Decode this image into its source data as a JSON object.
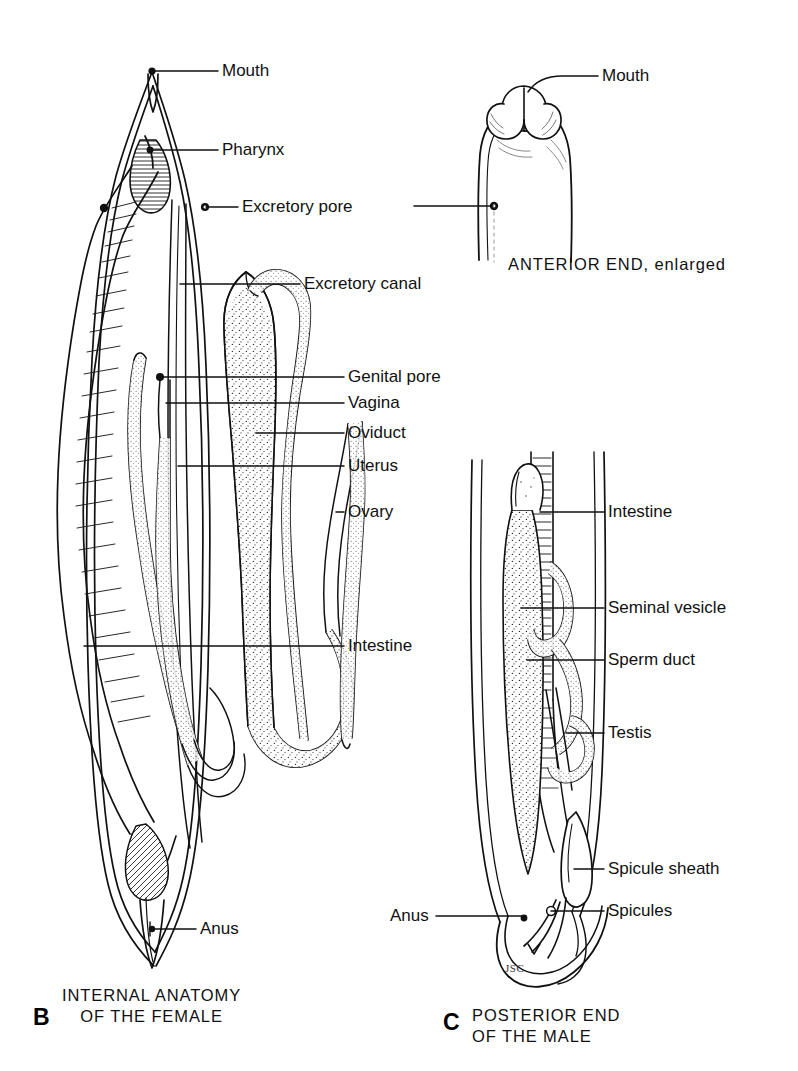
{
  "figure": {
    "ink_color": "#111111",
    "background_color": "#ffffff"
  },
  "panels": [
    {
      "id": "B",
      "letter": "B",
      "caption_line1": "INTERNAL ANATOMY",
      "caption_line2": "OF THE FEMALE",
      "labels": [
        {
          "name": "mouth",
          "text": "Mouth"
        },
        {
          "name": "pharynx",
          "text": "Pharynx"
        },
        {
          "name": "excretory-pore",
          "text": "Excretory pore"
        },
        {
          "name": "excretory-canal",
          "text": "Excretory canal"
        },
        {
          "name": "genital-pore",
          "text": "Genital pore"
        },
        {
          "name": "vagina",
          "text": "Vagina"
        },
        {
          "name": "oviduct",
          "text": "Oviduct"
        },
        {
          "name": "uterus",
          "text": "Uterus"
        },
        {
          "name": "ovary",
          "text": "Ovary"
        },
        {
          "name": "intestine",
          "text": "Intestine"
        },
        {
          "name": "anus",
          "text": "Anus"
        }
      ]
    },
    {
      "id": "A2",
      "letter": "",
      "caption_line1": "ANTERIOR END, enlarged",
      "caption_line2": "",
      "labels": [
        {
          "name": "mouth",
          "text": "Mouth"
        }
      ]
    },
    {
      "id": "C",
      "letter": "C",
      "caption_line1": "POSTERIOR END",
      "caption_line2": "OF THE MALE",
      "labels": [
        {
          "name": "intestine",
          "text": "Intestine"
        },
        {
          "name": "seminal-vesicle",
          "text": "Seminal vesicle"
        },
        {
          "name": "sperm-duct",
          "text": "Sperm duct"
        },
        {
          "name": "testis",
          "text": "Testis"
        },
        {
          "name": "spicule-sheath",
          "text": "Spicule sheath"
        },
        {
          "name": "spicules",
          "text": "Spicules"
        },
        {
          "name": "anus",
          "text": "Anus"
        }
      ]
    }
  ],
  "labels_female": {
    "mouth": "Mouth",
    "pharynx": "Pharynx",
    "excretory_pore": "Excretory pore",
    "excretory_canal": "Excretory canal",
    "genital_pore": "Genital pore",
    "vagina": "Vagina",
    "oviduct": "Oviduct",
    "uterus": "Uterus",
    "ovary": "Ovary",
    "intestine": "Intestine",
    "anus": "Anus"
  },
  "labels_anterior": {
    "mouth": "Mouth"
  },
  "labels_male": {
    "intestine": "Intestine",
    "seminal_vesicle": "Seminal vesicle",
    "sperm_duct": "Sperm duct",
    "testis": "Testis",
    "spicule_sheath": "Spicule sheath",
    "spicules": "Spicules",
    "anus": "Anus"
  },
  "captions": {
    "anterior": "ANTERIOR END, enlarged",
    "female_line1": "INTERNAL ANATOMY",
    "female_line2": "OF THE FEMALE",
    "male_line1": "POSTERIOR END",
    "male_line2": "OF THE MALE",
    "letter_b": "B",
    "letter_c": "C"
  },
  "signature": "JSC"
}
